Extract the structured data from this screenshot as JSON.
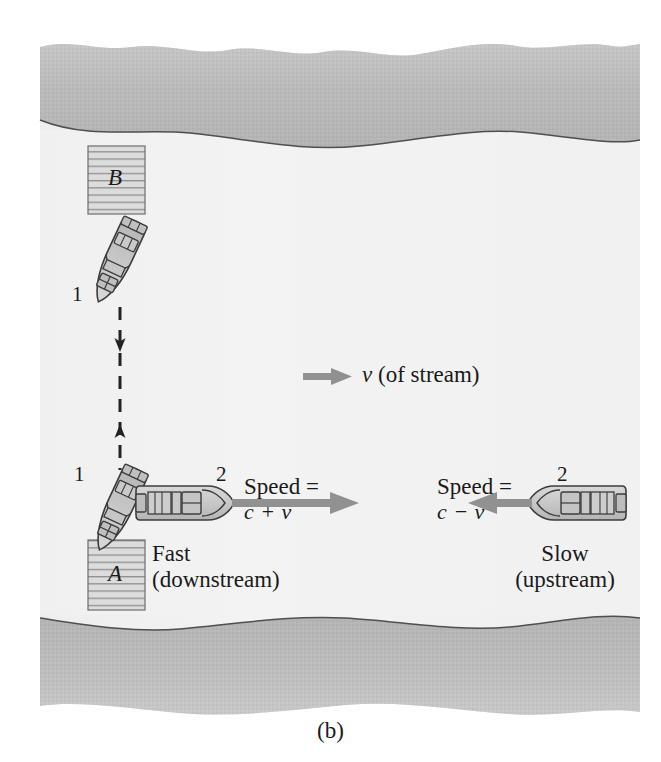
{
  "figure": {
    "caption": "(b)",
    "domain_note": "riverbank diagram"
  },
  "docks": [
    {
      "id": "dock-b",
      "letter": "B",
      "x": 88,
      "y": 146,
      "w": 57,
      "h": 68
    },
    {
      "id": "dock-a",
      "letter": "A",
      "x": 88,
      "y": 540,
      "w": 57,
      "h": 70
    }
  ],
  "boat_labels": [
    {
      "id": "boat-1-upper",
      "text": "1",
      "x": 72,
      "y": 283
    },
    {
      "id": "boat-1-lower",
      "text": "1",
      "x": 74,
      "y": 463
    },
    {
      "id": "boat-2-left",
      "text": "2",
      "x": 216,
      "y": 470
    },
    {
      "id": "boat-2-right",
      "text": "2",
      "x": 557,
      "y": 470
    }
  ],
  "stream": {
    "label_v": "v",
    "label_rest": " (of stream)",
    "arrow_x1": 303,
    "arrow_x2": 348,
    "arrow_y": 377
  },
  "downstream": {
    "speed_line1": "Speed =",
    "speed_line2": "c + v",
    "name_line1": "Fast",
    "name_line2": "(downstream)",
    "arrow_x1": 232,
    "arrow_x2": 358,
    "arrow_y": 503
  },
  "upstream": {
    "speed_line1": "Speed =",
    "speed_line2": "c − v",
    "name_line1": "Slow",
    "name_line2": "(upstream)",
    "arrow_x1": 531,
    "arrow_x2": 463,
    "arrow_y": 503
  },
  "colors": {
    "bank_fill": "#b9b9b9",
    "bank_edge": "#5a5a5a",
    "water_fill": "#f1f1f1",
    "dock_fill": "#d5d5d5",
    "boat_fill": "#c8c8c8",
    "arrow_gray": "#909090",
    "ink": "#1a1a1a"
  }
}
